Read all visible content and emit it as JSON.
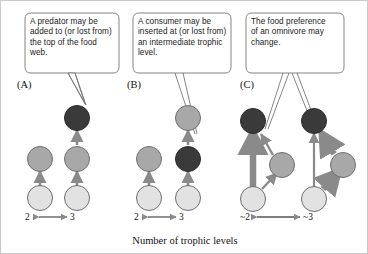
{
  "figure": {
    "caption": "Number of trophic levels",
    "colors": {
      "node_dark": "#3a3a3a",
      "node_medium": "#a8a8a8",
      "node_light": "#e2e2e2",
      "node_outline": "#6e6e6e",
      "arrow": "#8a8a8a",
      "callout_border": "#777777",
      "frame": "#c9c9c9",
      "text": "#1a1a1a"
    }
  },
  "panels": [
    {
      "letter": "(A)",
      "callout": "A predator may be added to (or lost from) the top of the food web.",
      "level_label_from": "2",
      "level_label_to": "3",
      "nodes": [
        {
          "name": "producer-left",
          "shade": "light"
        },
        {
          "name": "consumer-left",
          "shade": "medium"
        },
        {
          "name": "producer-right",
          "shade": "light"
        },
        {
          "name": "consumer-right",
          "shade": "medium"
        },
        {
          "name": "predator-added",
          "shade": "dark"
        }
      ]
    },
    {
      "letter": "(B)",
      "callout": "A consumer may be inserted at (or lost from) an intermediate trophic level.",
      "level_label_from": "2",
      "level_label_to": "3",
      "nodes": [
        {
          "name": "producer-left",
          "shade": "light"
        },
        {
          "name": "consumer-left",
          "shade": "medium"
        },
        {
          "name": "producer-right",
          "shade": "light"
        },
        {
          "name": "consumer-inserted",
          "shade": "dark"
        },
        {
          "name": "predator-right",
          "shade": "medium"
        }
      ]
    },
    {
      "letter": "(C)",
      "callout": "The food preference of an omnivore may change.",
      "level_label_from": "~2",
      "level_label_to": "~3",
      "nodes": [
        {
          "name": "producer-left",
          "shade": "light"
        },
        {
          "name": "intermediate-left",
          "shade": "medium"
        },
        {
          "name": "omnivore-left",
          "shade": "dark"
        },
        {
          "name": "producer-right",
          "shade": "light"
        },
        {
          "name": "intermediate-right",
          "shade": "medium"
        },
        {
          "name": "omnivore-right",
          "shade": "dark"
        }
      ]
    }
  ],
  "level_arrow_symbol": "⟷"
}
